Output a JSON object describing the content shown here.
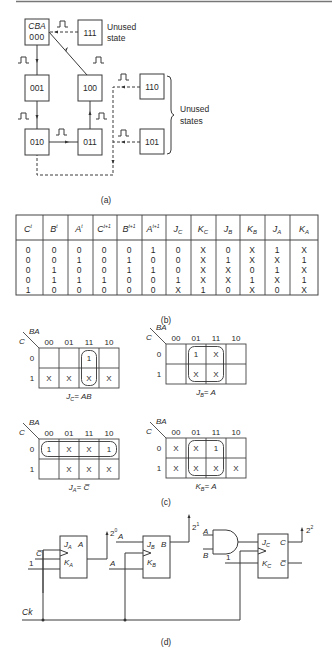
{
  "panel_a": {
    "caption": "(a)",
    "header_label": "CBA",
    "states": [
      {
        "id": "s000",
        "label": "000"
      },
      {
        "id": "s001",
        "label": "001"
      },
      {
        "id": "s010",
        "label": "010"
      },
      {
        "id": "s011",
        "label": "011"
      },
      {
        "id": "s100",
        "label": "100"
      },
      {
        "id": "s111",
        "label": "111"
      },
      {
        "id": "s110",
        "label": "110"
      },
      {
        "id": "s101",
        "label": "101"
      }
    ],
    "unused_state_label_1": "Unused",
    "unused_state_label_2": "state",
    "unused_states_label_1": "Unused",
    "unused_states_label_2": "states"
  },
  "panel_b": {
    "caption": "(b)",
    "headers": [
      "C",
      "B",
      "A",
      "C",
      "B",
      "A",
      "J",
      "K",
      "J",
      "K",
      "J",
      "K"
    ],
    "header_sups": [
      "t",
      "t",
      "t",
      "t+1",
      "t+1",
      "t+1",
      "",
      "",
      "",
      "",
      "",
      ""
    ],
    "header_subs": [
      "",
      "",
      "",
      "",
      "",
      "",
      "C",
      "C",
      "B",
      "B",
      "A",
      "A"
    ],
    "rows": [
      [
        "0",
        "0",
        "0",
        "0",
        "0",
        "1",
        "0",
        "X",
        "0",
        "X",
        "1",
        "X"
      ],
      [
        "0",
        "0",
        "1",
        "0",
        "1",
        "0",
        "0",
        "X",
        "1",
        "X",
        "X",
        "1"
      ],
      [
        "0",
        "1",
        "0",
        "0",
        "1",
        "1",
        "0",
        "X",
        "X",
        "0",
        "1",
        "X"
      ],
      [
        "0",
        "1",
        "1",
        "1",
        "0",
        "0",
        "1",
        "X",
        "X",
        "1",
        "X",
        "1"
      ],
      [
        "1",
        "0",
        "0",
        "0",
        "0",
        "0",
        "X",
        "1",
        "0",
        "X",
        "0",
        "X"
      ]
    ]
  },
  "panel_c": {
    "caption": "(c)",
    "col_var": "BA",
    "row_var": "C",
    "col_labels": [
      "00",
      "01",
      "11",
      "10"
    ],
    "row_labels": [
      "0",
      "1"
    ],
    "maps": [
      {
        "name": "J_C",
        "result_lhs": "J",
        "result_sub": "C",
        "result_rhs": "= AB",
        "cells": [
          [
            "",
            "",
            "1",
            ""
          ],
          [
            "X",
            "X",
            "X",
            "X"
          ]
        ]
      },
      {
        "name": "J_B",
        "result_lhs": "J",
        "result_sub": "B",
        "result_rhs": "= A",
        "cells": [
          [
            "",
            "1",
            "X",
            ""
          ],
          [
            "",
            "X",
            "X",
            ""
          ]
        ]
      },
      {
        "name": "J_A",
        "result_lhs": "J",
        "result_sub": "A",
        "result_rhs": "= C̅",
        "cells": [
          [
            "1",
            "X",
            "X",
            "1"
          ],
          [
            "",
            "X",
            "X",
            "X"
          ]
        ]
      },
      {
        "name": "K_B",
        "result_lhs": "K",
        "result_sub": "B",
        "result_rhs": "= A",
        "cells": [
          [
            "X",
            "X",
            "1",
            ""
          ],
          [
            "X",
            "X",
            "X",
            "X"
          ]
        ]
      }
    ]
  },
  "panel_d": {
    "caption": "(d)",
    "clock_label": "Ck",
    "flipflops": [
      {
        "name": "A",
        "j_label": "J",
        "j_sub": "A",
        "k_label": "K",
        "k_sub": "A",
        "q_label": "A",
        "j_input": "C̅",
        "k_input": "1",
        "output_weight": "2",
        "output_exp": "0"
      },
      {
        "name": "B",
        "j_label": "J",
        "j_sub": "B",
        "k_label": "K",
        "k_sub": "B",
        "q_label": "B",
        "j_input": "A",
        "k_input": "A",
        "output_weight": "2",
        "output_exp": "1"
      },
      {
        "name": "C",
        "j_label": "J",
        "j_sub": "C",
        "k_label": "K",
        "k_sub": "C",
        "q_label": "C",
        "qbar_label": "C̅",
        "k_input": "1",
        "output_weight": "2",
        "output_exp": "2"
      }
    ],
    "and_gate_inputs": [
      "A",
      "B"
    ]
  }
}
